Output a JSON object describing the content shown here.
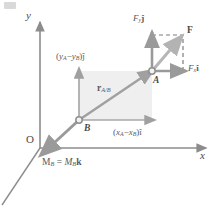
{
  "figure": {
    "background_color": "#ffffff",
    "axes": {
      "y_label": "y",
      "x_label": "x",
      "origin_label": "O",
      "axis_color": "#8c8c8c"
    },
    "points": [
      {
        "name": "point-a",
        "label": "A",
        "x": 152,
        "y": 71
      },
      {
        "name": "point-b",
        "label": "B",
        "x": 79,
        "y": 120
      }
    ],
    "vectors": {
      "force": {
        "label": "F",
        "color": "#b3b3b3",
        "from": [
          152,
          71
        ],
        "to": [
          183,
          35
        ]
      },
      "force_y_component": {
        "label": "Fy ĵ",
        "label_main": "F",
        "label_sub": "y",
        "label_unit": "ĵ",
        "color": "#9a9a9a",
        "from": [
          152,
          71
        ],
        "to": [
          152,
          35
        ]
      },
      "force_x_component": {
        "label": "Fx î",
        "label_main": "F",
        "label_sub": "x",
        "label_unit": "î",
        "color": "#9a9a9a",
        "from": [
          152,
          71
        ],
        "to": [
          183,
          71
        ]
      },
      "position": {
        "label": "rA/B",
        "label_main": "r",
        "label_sub": "A/B",
        "color": "#a0a0a0",
        "from": [
          79,
          120
        ],
        "to": [
          152,
          71
        ]
      },
      "position_y_component": {
        "label": "(yA − yB)ĵ",
        "color": "#a0a0a0",
        "from": [
          79,
          120
        ],
        "to": [
          79,
          71
        ]
      },
      "position_x_component": {
        "label": "(xA − xB)î",
        "color": "#a0a0a0",
        "from": [
          79,
          120
        ],
        "to": [
          152,
          120
        ]
      },
      "moment": {
        "label": "MB = MB k",
        "color": "#9a9a9a",
        "from": [
          79,
          120
        ],
        "to": [
          43,
          154
        ]
      }
    },
    "shaded_rectangle": {
      "fill": "#eeeeee",
      "x": 79,
      "y": 71,
      "width": 73,
      "height": 49
    },
    "dashed_box": {
      "color": "#7d7d7d",
      "x": 152,
      "y": 35,
      "width": 31,
      "height": 36
    }
  },
  "labels": {
    "y_axis": "y",
    "x_axis": "x",
    "origin": "O",
    "point_a": "A",
    "point_b": "B",
    "force": "F",
    "force_y_main": "F",
    "force_y_sub": "y",
    "force_y_unit": "ĵ",
    "force_x_main": "F",
    "force_x_sub": "x",
    "force_x_unit": "î",
    "r_main": "r",
    "r_sub": "A/B",
    "dy_open": "(",
    "dy_y1": "y",
    "dy_sub1": "A",
    "dy_minus": "−",
    "dy_y2": "y",
    "dy_sub2": "B",
    "dy_close": ")ĵ",
    "dx_open": "(",
    "dx_x1": "x",
    "dx_sub1": "A",
    "dx_minus": "−",
    "dx_x2": "x",
    "dx_sub2": "B",
    "dx_close": ")î",
    "m_main": "M",
    "m_sub1": "B",
    "m_eq": " = ",
    "m_main2": "M",
    "m_sub2": "B",
    "m_k": "k"
  }
}
